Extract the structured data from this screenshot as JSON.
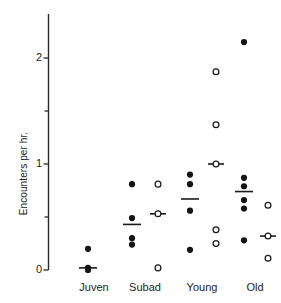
{
  "chart_data": {
    "type": "scatter",
    "title": "",
    "xlabel": "",
    "ylabel": "Encounters per hr.",
    "ylim": [
      0,
      2.4
    ],
    "yticks_major": [
      0,
      1,
      2
    ],
    "yticks_major_labels": [
      "0",
      "1",
      "2"
    ],
    "yticks_minor": [
      0.5,
      1.5
    ],
    "grid": false,
    "legend": "none",
    "categories": [
      "Juven",
      "Subad",
      "Young",
      "Old"
    ],
    "series": [
      {
        "name": "filled",
        "marker": "filled-circle",
        "color": "#141414",
        "groups": [
          {
            "category": "Juven",
            "values": [
              0.2,
              0.02,
              0.0
            ],
            "mean": 0.02
          },
          {
            "category": "Subad",
            "values": [
              0.81,
              0.49,
              0.3,
              0.24
            ],
            "mean": 0.43
          },
          {
            "category": "Young",
            "values": [
              0.9,
              0.81,
              0.56,
              0.19
            ],
            "mean": 0.67
          },
          {
            "category": "Old",
            "values": [
              2.15,
              0.87,
              0.79,
              0.66,
              0.58,
              0.28
            ],
            "mean": 0.74
          }
        ]
      },
      {
        "name": "open",
        "marker": "open-circle",
        "color": "#ffffff",
        "groups": [
          {
            "category": "Juven",
            "values": [],
            "mean": null
          },
          {
            "category": "Subad",
            "values": [
              0.81,
              0.53,
              0.02
            ],
            "mean": 0.53
          },
          {
            "category": "Young",
            "values": [
              1.87,
              1.37,
              1.0,
              0.38,
              0.25
            ],
            "mean": 1.0
          },
          {
            "category": "Old",
            "values": [
              0.61,
              0.32,
              0.11
            ],
            "mean": 0.32
          }
        ]
      }
    ]
  },
  "axis": {
    "ylabel": "Encounters per hr.",
    "tick_0": "0",
    "tick_1": "1",
    "tick_2": "2"
  },
  "xaxis": {
    "juven": "Juven",
    "subad": "Subad",
    "young": "Young",
    "old": "Old"
  }
}
